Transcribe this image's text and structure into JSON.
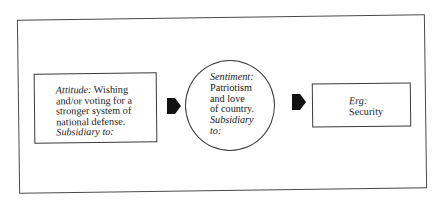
{
  "diagram": {
    "type": "flow",
    "direction": "left-to-right",
    "colors": {
      "stroke": "#3a3a3a",
      "frame": "#4a4a4a",
      "arrow_fill": "#111111",
      "background": "#ffffff"
    },
    "nodes": [
      {
        "id": "attitude",
        "shape": "rectangle",
        "label_term": "Attitude:",
        "lines": [
          "Wishing",
          "and/or voting for a",
          "stronger system of",
          "national defense."
        ],
        "footer": "Subsidiary to:"
      },
      {
        "id": "sentiment",
        "shape": "circle",
        "label_term": "Sentiment:",
        "lines": [
          "Patriotism",
          "and love",
          "of country."
        ],
        "footer_lines": [
          "Subsidiary",
          "to:"
        ]
      },
      {
        "id": "erg",
        "shape": "rectangle",
        "label_term": "Erg:",
        "lines": [
          "Security"
        ]
      }
    ],
    "edges": [
      {
        "from": "attitude",
        "to": "sentiment",
        "icon": "arrow-right-icon"
      },
      {
        "from": "sentiment",
        "to": "erg",
        "icon": "arrow-right-icon"
      }
    ]
  }
}
